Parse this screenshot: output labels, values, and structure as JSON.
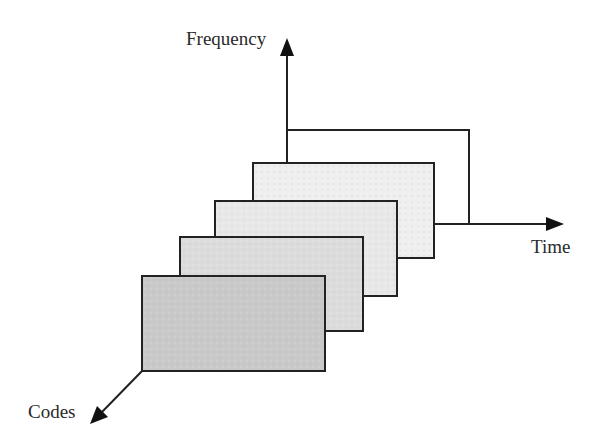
{
  "diagram": {
    "axes": {
      "frequency": {
        "label": "Frequency"
      },
      "time": {
        "label": "Time"
      },
      "codes": {
        "label": "Codes"
      }
    },
    "colors": {
      "stroke": "#222222",
      "text": "#2a2a2a",
      "frame_fills": [
        "#c9c9c9",
        "#dcdcdc",
        "#e8e8e8",
        "#efefef",
        "#ffffff"
      ]
    },
    "frames": [
      {
        "id": "frame-1",
        "position": "front"
      },
      {
        "id": "frame-2",
        "position": "second"
      },
      {
        "id": "frame-3",
        "position": "third"
      },
      {
        "id": "frame-4",
        "position": "fourth"
      },
      {
        "id": "frame-5",
        "position": "back"
      }
    ]
  }
}
